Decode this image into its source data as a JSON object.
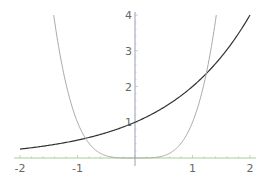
{
  "chart_data": {
    "type": "line",
    "title": "",
    "xlabel": "",
    "ylabel": "",
    "xlim": [
      -2,
      2
    ],
    "ylim": [
      0,
      4
    ],
    "grid": false,
    "legend": null,
    "x_ticks": [
      {
        "value": -2,
        "label": "-2"
      },
      {
        "value": -1,
        "label": "-1"
      },
      {
        "value": 1,
        "label": "1"
      },
      {
        "value": 2,
        "label": "2"
      }
    ],
    "y_ticks": [
      {
        "value": 1,
        "label": "1"
      },
      {
        "value": 2,
        "label": "2"
      },
      {
        "value": 3,
        "label": "3"
      },
      {
        "value": 4,
        "label": "4"
      }
    ],
    "series": [
      {
        "name": "2^x",
        "color": "#333333",
        "x": [
          -2,
          -1.5,
          -1,
          -0.5,
          0,
          0.5,
          1,
          1.5,
          2
        ],
        "values": [
          0.25,
          0.354,
          0.5,
          0.707,
          1,
          1.414,
          2,
          2.828,
          4
        ]
      },
      {
        "name": "x^4",
        "color": "#aaaaaa",
        "x": [
          -1.414,
          -1.25,
          -1,
          -0.75,
          -0.5,
          -0.25,
          0,
          0.25,
          0.5,
          0.75,
          1,
          1.25,
          1.414
        ],
        "values": [
          4,
          2.441,
          1,
          0.316,
          0.0625,
          0.0039,
          0,
          0.0039,
          0.0625,
          0.316,
          1,
          2.441,
          4
        ]
      }
    ],
    "axes": {
      "x_axis_color": "#a8d08d",
      "y_axis_color": "#9aa0b0"
    }
  }
}
